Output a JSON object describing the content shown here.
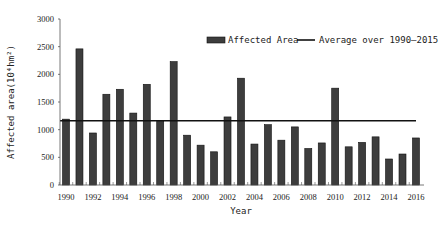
{
  "chart_data": {
    "type": "bar",
    "title": "",
    "xlabel": "Year",
    "ylabel": "Affected area(10⁴hm²)",
    "ylim": [
      0,
      3000
    ],
    "yticks": [
      0,
      500,
      1000,
      1500,
      2000,
      2500,
      3000
    ],
    "xtick_labels": [
      "1990",
      "1992",
      "1994",
      "1996",
      "1998",
      "2000",
      "2002",
      "2004",
      "2006",
      "2008",
      "2010",
      "2012",
      "2014",
      "2016"
    ],
    "categories": [
      "1990",
      "1991",
      "1992",
      "1993",
      "1994",
      "1995",
      "1996",
      "1997",
      "1998",
      "1999",
      "2000",
      "2001",
      "2002",
      "2003",
      "2004",
      "2005",
      "2006",
      "2007",
      "2008",
      "2009",
      "2010",
      "2011",
      "2012",
      "2013",
      "2014",
      "2015",
      "2016"
    ],
    "series": [
      {
        "name": "Affected Area",
        "type": "bar",
        "color": "#3d3d3d",
        "values": [
          1190,
          2460,
          940,
          1640,
          1730,
          1300,
          1820,
          1150,
          2230,
          900,
          720,
          600,
          1230,
          1930,
          740,
          1090,
          810,
          1050,
          660,
          760,
          1750,
          690,
          770,
          870,
          470,
          560,
          850
        ]
      },
      {
        "name": "Average over 1990—2015",
        "type": "line",
        "color": "#111111",
        "value": 1160
      }
    ],
    "grid": false,
    "legend_position": "top-right"
  },
  "legend": {
    "bar_label": "Affected Area",
    "line_label": "Average over 1990—2015"
  },
  "axes": {
    "x_title": "Year",
    "y_title": "Affected area(10⁴hm²)"
  }
}
